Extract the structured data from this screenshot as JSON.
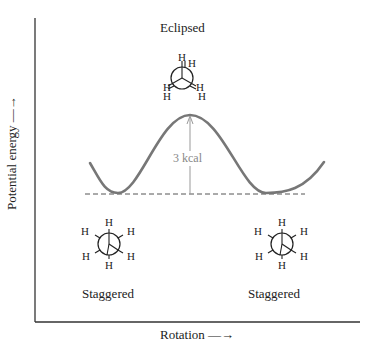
{
  "diagram": {
    "type": "potential-energy-vs-rotation",
    "axes": {
      "ylabel": "Potential energy",
      "ylabel_arrow": "—→",
      "xlabel": "Rotation",
      "xlabel_arrow": "—→"
    },
    "conformations": [
      {
        "label": "Eclipsed",
        "position": "top-center",
        "projection": "newman-eclipsed",
        "atoms": [
          "H",
          "H",
          "H",
          "H",
          "H",
          "H"
        ]
      },
      {
        "label": "Staggered",
        "position": "bottom-left",
        "projection": "newman-staggered",
        "atoms": [
          "H",
          "H",
          "H",
          "H",
          "H",
          "H"
        ]
      },
      {
        "label": "Staggered",
        "position": "bottom-right",
        "projection": "newman-staggered",
        "atoms": [
          "H",
          "H",
          "H",
          "H",
          "H",
          "H"
        ]
      }
    ],
    "energy_barrier": {
      "label": "3 kcal",
      "value": 3,
      "unit": "kcal"
    },
    "colors": {
      "curve": "#777777",
      "axes": "#333333",
      "arrow": "#999999",
      "baseline_dash": "#555555"
    },
    "atom_symbol": "H"
  }
}
